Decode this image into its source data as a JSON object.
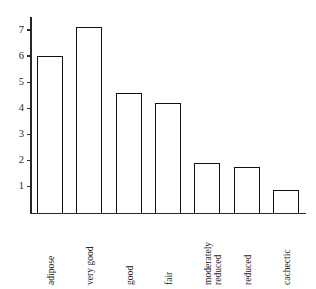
{
  "chart_data": {
    "type": "bar",
    "title": "",
    "subtitle": "",
    "xlabel": "",
    "ylabel": "",
    "categories": [
      "adipose",
      "very good",
      "good",
      "fair",
      "moderately reduced",
      "reduced",
      "cachectic"
    ],
    "category_lines": [
      [
        "adipose"
      ],
      [
        "very good"
      ],
      [
        "good"
      ],
      [
        "fair"
      ],
      [
        "moderately",
        "reduced"
      ],
      [
        "reduced"
      ],
      [
        "cachectic"
      ]
    ],
    "values": [
      6.0,
      7.1,
      4.6,
      4.2,
      1.9,
      1.75,
      0.85
    ],
    "ylim": [
      0,
      7.5
    ],
    "yticks": [
      1,
      2,
      3,
      4,
      5,
      6,
      7
    ],
    "ytick_labels": [
      "1",
      "2",
      "3",
      "4",
      "5",
      "6",
      "7"
    ],
    "grid": false,
    "legend": false,
    "legend_position": "none",
    "bar_fill_color": "#ffffff",
    "bar_edge_color": "#111111",
    "axis_color": "#262626",
    "background_color": "#ffffff"
  }
}
